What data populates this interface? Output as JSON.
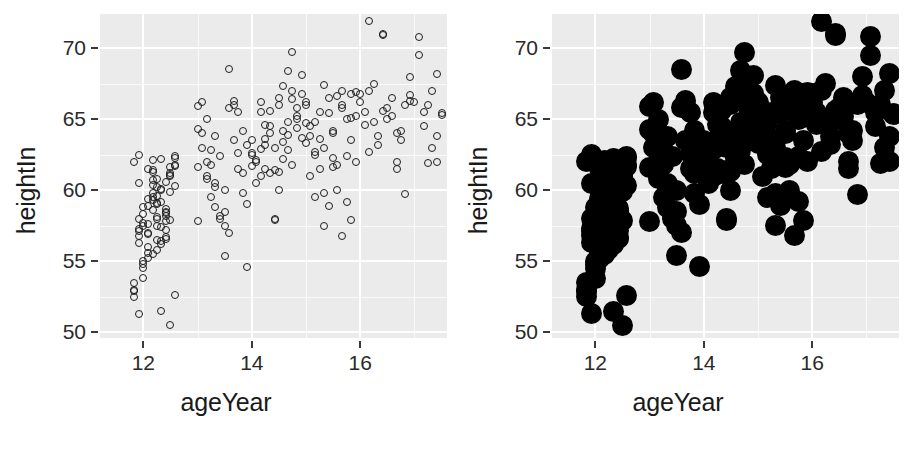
{
  "figure": {
    "width": 904,
    "height": 451,
    "background": "#ffffff",
    "panel_background": "#ebebeb",
    "gridline_color": "#ffffff"
  },
  "panels": [
    {
      "id": "left",
      "name": "scatter-open-points",
      "point_style": "open-circle",
      "point_color": "#1d1d1d",
      "point_size_px": 8
    },
    {
      "id": "right",
      "name": "scatter-solid-points",
      "point_style": "filled-circle",
      "point_color": "#000000",
      "point_size_px": 21
    }
  ],
  "chart_data": {
    "type": "scatter",
    "title": "",
    "xlabel": "ageYear",
    "ylabel": "heightIn",
    "xlim": [
      11.2,
      17.6
    ],
    "ylim": [
      49.6,
      72.4
    ],
    "xticks": [
      12,
      14,
      16
    ],
    "xtick_labels": [
      "12",
      "14",
      "16"
    ],
    "yticks": [
      50,
      55,
      60,
      65,
      70
    ],
    "ytick_labels": [
      "50",
      "55",
      "60",
      "65",
      "70"
    ],
    "x_minor_ticks": [
      13,
      15,
      17
    ],
    "y_minor_ticks": [
      52.5,
      57.5,
      62.5,
      67.5
    ],
    "grid": true,
    "legend": null,
    "n_points": 236,
    "series": [
      {
        "name": "heightweight",
        "x": [
          11.92,
          12.0,
          12.17,
          12.08,
          11.92,
          12.25,
          12.25,
          12.08,
          12.42,
          12.33,
          12.5,
          12.25,
          11.92,
          11.83,
          11.92,
          12.17,
          12.0,
          12.58,
          11.83,
          12.5,
          12.25,
          12.25,
          12.42,
          12.33,
          12.17,
          12.0,
          12.08,
          12.58,
          12.42,
          12.17,
          12.33,
          12.42,
          12.25,
          12.08,
          12.0,
          11.92,
          12.5,
          12.58,
          12.33,
          12.17,
          11.83,
          12.0,
          12.08,
          12.42,
          12.17,
          11.92,
          12.25,
          12.33,
          12.5,
          12.58,
          12.42,
          12.08,
          12.0,
          11.83,
          12.17,
          12.25,
          12.33,
          12.08,
          12.5,
          12.42,
          11.92,
          12.0,
          12.25,
          12.17,
          12.58,
          12.33,
          12.08,
          12.42,
          12.5,
          11.83,
          12.0,
          12.17,
          12.25,
          12.33,
          12.42,
          12.58,
          12.08,
          11.92,
          12.5,
          12.17,
          13.0,
          13.08,
          13.17,
          13.25,
          13.33,
          13.42,
          13.5,
          13.58,
          13.67,
          13.75,
          13.83,
          13.92,
          13.0,
          13.17,
          13.33,
          13.5,
          13.67,
          13.83,
          13.08,
          13.25,
          13.42,
          13.58,
          13.75,
          13.92,
          13.0,
          13.17,
          13.33,
          13.5,
          13.67,
          13.83,
          13.08,
          13.25,
          13.42,
          13.58,
          13.75,
          13.92,
          13.0,
          13.17,
          13.33,
          13.5,
          14.0,
          14.08,
          14.17,
          14.25,
          14.33,
          14.42,
          14.5,
          14.58,
          14.67,
          14.75,
          14.83,
          14.92,
          14.0,
          14.17,
          14.33,
          14.5,
          14.67,
          14.83,
          14.08,
          14.25,
          14.42,
          14.58,
          14.75,
          14.92,
          14.0,
          14.17,
          14.33,
          14.5,
          14.67,
          14.83,
          14.08,
          14.25,
          14.42,
          14.58,
          14.75,
          14.92,
          14.0,
          14.17,
          14.33,
          14.5,
          14.67,
          14.83,
          14.25,
          14.42,
          14.58,
          14.75,
          15.0,
          15.08,
          15.17,
          15.25,
          15.33,
          15.42,
          15.5,
          15.58,
          15.67,
          15.75,
          15.83,
          15.92,
          15.0,
          15.17,
          15.33,
          15.5,
          15.67,
          15.83,
          15.08,
          15.25,
          15.42,
          15.58,
          15.75,
          15.92,
          15.0,
          15.17,
          15.33,
          15.5,
          15.67,
          15.83,
          15.08,
          15.25,
          15.42,
          15.58,
          15.75,
          15.92,
          15.0,
          15.17,
          15.33,
          15.5,
          15.67,
          15.83,
          16.0,
          16.08,
          16.17,
          16.25,
          16.33,
          16.42,
          16.5,
          16.58,
          16.67,
          16.75,
          16.83,
          16.92,
          16.0,
          16.17,
          16.33,
          16.5,
          16.67,
          16.83,
          16.08,
          16.25,
          16.42,
          16.58,
          16.75,
          16.92,
          16.17,
          16.42,
          16.67,
          16.92,
          17.0,
          17.08,
          17.17,
          17.25,
          17.33,
          17.42,
          17.5,
          17.08,
          17.25,
          17.42,
          17.17,
          17.33,
          17.5,
          17.42
        ],
        "y": [
          62.5,
          58.3,
          59.8,
          61.5,
          56.8,
          60.2,
          57.5,
          57.0,
          58.5,
          56.2,
          61.0,
          59.0,
          57.3,
          62.0,
          60.5,
          62.1,
          55.0,
          61.8,
          53.5,
          61.2,
          58.0,
          56.5,
          57.8,
          60.0,
          59.5,
          58.8,
          56.0,
          62.3,
          57.2,
          55.5,
          59.2,
          58.2,
          60.8,
          57.6,
          53.8,
          56.3,
          61.6,
          60.3,
          57.4,
          58.6,
          53.0,
          54.8,
          55.2,
          56.7,
          61.4,
          57.1,
          59.6,
          62.2,
          59.9,
          61.7,
          58.4,
          56.9,
          57.7,
          52.9,
          60.7,
          55.8,
          60.1,
          58.9,
          57.9,
          56.6,
          51.3,
          54.5,
          58.1,
          61.3,
          62.4,
          51.5,
          59.4,
          60.6,
          50.5,
          52.5,
          57.5,
          60.4,
          59.1,
          56.4,
          58.7,
          52.6,
          55.6,
          58.0,
          61.1,
          59.3,
          64.3,
          66.2,
          61.0,
          62.8,
          60.2,
          58.0,
          57.5,
          65.8,
          63.5,
          61.5,
          59.8,
          54.6,
          65.9,
          62.0,
          60.5,
          58.5,
          66.0,
          64.2,
          63.0,
          61.8,
          58.2,
          68.5,
          62.6,
          59.0,
          57.8,
          65.0,
          63.8,
          60.0,
          66.3,
          61.2,
          64.0,
          59.5,
          62.4,
          57.0,
          65.5,
          63.2,
          61.6,
          60.8,
          58.8,
          55.4,
          63.5,
          62.0,
          65.5,
          61.5,
          64.0,
          63.0,
          66.0,
          62.2,
          64.8,
          61.8,
          65.2,
          63.7,
          62.5,
          61.0,
          64.5,
          66.5,
          62.8,
          65.0,
          60.5,
          63.2,
          61.4,
          64.2,
          69.7,
          68.1,
          62.6,
          66.2,
          61.2,
          60.0,
          63.9,
          65.8,
          62.1,
          64.6,
          57.9,
          63.4,
          67.0,
          66.8,
          61.7,
          62.9,
          65.6,
          61.3,
          68.4,
          64.4,
          63.6,
          58.0,
          67.3,
          66.4,
          66.0,
          64.5,
          62.5,
          65.5,
          63.0,
          66.5,
          64.0,
          61.8,
          67.0,
          65.0,
          63.5,
          62.0,
          66.2,
          64.8,
          59.8,
          62.3,
          65.8,
          66.8,
          63.8,
          61.5,
          58.9,
          66.6,
          59.2,
          65.2,
          63.3,
          62.7,
          57.5,
          64.2,
          66.0,
          57.9,
          61.0,
          63.6,
          65.4,
          60.0,
          62.4,
          66.9,
          64.7,
          59.5,
          67.4,
          61.6,
          56.8,
          65.1,
          66.2,
          65.5,
          67.0,
          64.8,
          63.2,
          71.0,
          65.0,
          66.5,
          62.0,
          64.2,
          59.7,
          68.0,
          66.8,
          71.9,
          63.8,
          65.8,
          61.5,
          66.0,
          64.6,
          67.5,
          70.9,
          65.2,
          63.5,
          66.3,
          62.7,
          65.6,
          64.0,
          66.7,
          66.2,
          70.8,
          65.5,
          61.9,
          63.0,
          68.2,
          65.3,
          69.5,
          66.0,
          62.0,
          64.5,
          67.0,
          65.4,
          63.8
        ]
      }
    ]
  },
  "axes": {
    "panel_left_px": 100,
    "panel_top_px": 14,
    "panel_width_px": 347,
    "panel_height_px": 324,
    "right_panel_left_px": 532
  }
}
